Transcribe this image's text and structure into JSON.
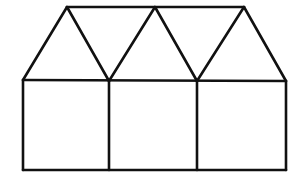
{
  "diagram": {
    "stroke_color": "#111111",
    "background": "#ffffff",
    "stroke_width": 2.6,
    "points": {
      "base_left_top": [
        23,
        80
      ],
      "base_left_bottom": [
        23,
        170
      ],
      "divider1_top": [
        109,
        81
      ],
      "divider1_bottom": [
        109,
        170
      ],
      "divider2_top": [
        197,
        81
      ],
      "divider2_bottom": [
        197,
        170
      ],
      "base_right_top": [
        286,
        81
      ],
      "base_right_bottom": [
        286,
        170
      ],
      "apex1": [
        67,
        7
      ],
      "apex2": [
        155,
        7
      ],
      "apex3": [
        244,
        7
      ]
    },
    "squares": 3,
    "triangles_upward": 3,
    "triangles_downward": 2
  }
}
